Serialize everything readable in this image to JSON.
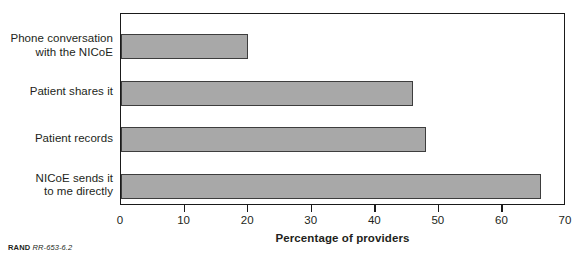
{
  "chart_data": {
    "type": "bar",
    "orientation": "horizontal",
    "title": "",
    "xlabel": "Percentage of providers",
    "ylabel": "",
    "xlim": [
      0,
      70
    ],
    "xticks": [
      0,
      10,
      20,
      30,
      40,
      50,
      60,
      70
    ],
    "grid": false,
    "legend": null,
    "categories": [
      "Phone conversation with the NICoE",
      "Patient shares it",
      "Patient records",
      "NICoE sends it to me directly"
    ],
    "category_lines": [
      [
        "Phone conversation",
        "with the NICoE"
      ],
      [
        "Patient shares it"
      ],
      [
        "Patient records"
      ],
      [
        "NICoE sends it",
        "to me directly"
      ]
    ],
    "values": [
      20,
      46,
      48,
      66
    ],
    "bar_color": "#a8a8a8",
    "bar_border_color": "#3d3d3d",
    "axis_color": "#1a1a1a"
  },
  "credit": {
    "brand": "RAND",
    "id": "RR-653-6.2"
  }
}
